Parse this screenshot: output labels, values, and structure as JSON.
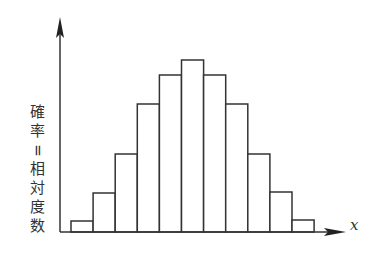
{
  "chart_data": {
    "type": "bar",
    "title": "",
    "xlabel": "x",
    "ylabel": "確率=相対度数",
    "categories": [
      "1",
      "2",
      "3",
      "4",
      "5",
      "6",
      "7",
      "8",
      "9",
      "10",
      "11"
    ],
    "values": [
      11,
      39,
      78,
      128,
      157,
      172,
      157,
      128,
      78,
      40,
      12
    ],
    "value_units": "relative height (pixels above baseline; no axis ticks shown)",
    "grid": false,
    "legend": null,
    "ticks": "none",
    "style": {
      "bar_fill": "#ffffff",
      "bar_stroke": "#333333",
      "axis_color": "#333333"
    }
  },
  "axes": {
    "x_label": "x",
    "y_label_chars": [
      "確",
      "率",
      "=",
      "相",
      "対",
      "度",
      "数"
    ]
  }
}
